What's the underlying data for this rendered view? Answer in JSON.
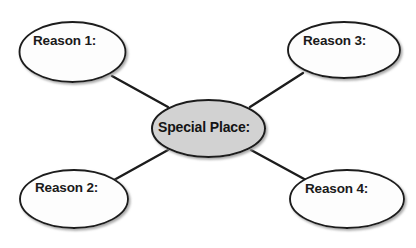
{
  "diagram": {
    "type": "concept-map-spider",
    "background_color": "#ffffff",
    "center": {
      "label": "Special Place:",
      "fill_color": "#d2d2d2",
      "stroke_color": "#1c1c1c",
      "cx": 208.5,
      "cy": 128.5,
      "rx": 56.5,
      "ry": 28.5
    },
    "nodes": [
      {
        "id": "reason-1",
        "label": "Reason 1:",
        "position": "top-left",
        "fill_color": "#fdfdfd",
        "stroke_color": "#1c1c1c",
        "cx": 72.5,
        "cy": 52.0,
        "rx": 53.0,
        "ry": 30.0,
        "label_x": 33,
        "label_y": 33
      },
      {
        "id": "reason-3",
        "label": "Reason 3:",
        "position": "top-right",
        "fill_color": "#fdfdfd",
        "stroke_color": "#1c1c1c",
        "cx": 344.0,
        "cy": 50.0,
        "rx": 56.0,
        "ry": 28.0,
        "label_x": 303,
        "label_y": 33
      },
      {
        "id": "reason-2",
        "label": "Reason 2:",
        "position": "bottom-left",
        "fill_color": "#fdfdfd",
        "stroke_color": "#1c1c1c",
        "cx": 74.0,
        "cy": 199.0,
        "rx": 54.0,
        "ry": 29.0,
        "label_x": 35,
        "label_y": 180
      },
      {
        "id": "reason-4",
        "label": "Reason 4:",
        "position": "bottom-right",
        "fill_color": "#fdfdfd",
        "stroke_color": "#1c1c1c",
        "cx": 347.0,
        "cy": 199.0,
        "rx": 57.0,
        "ry": 29.0,
        "label_x": 305,
        "label_y": 181
      }
    ],
    "connectors": [
      {
        "id": "connector-center-reason-1",
        "from": "center",
        "to": "reason-1",
        "x1": 168,
        "y1": 107,
        "x2": 112,
        "y2": 76,
        "stroke_color": "#1c1c1c",
        "stroke_width": 2.4
      },
      {
        "id": "connector-center-reason-3",
        "from": "center",
        "to": "reason-3",
        "x1": 250,
        "y1": 107,
        "x2": 303,
        "y2": 73,
        "stroke_color": "#1c1c1c",
        "stroke_width": 2.4
      },
      {
        "id": "connector-center-reason-2",
        "from": "center",
        "to": "reason-2",
        "x1": 168,
        "y1": 150,
        "x2": 114,
        "y2": 180,
        "stroke_color": "#1c1c1c",
        "stroke_width": 2.4
      },
      {
        "id": "connector-center-reason-4",
        "from": "center",
        "to": "reason-4",
        "x1": 251,
        "y1": 150,
        "x2": 306,
        "y2": 180,
        "stroke_color": "#1c1c1c",
        "stroke_width": 2.4
      }
    ]
  }
}
